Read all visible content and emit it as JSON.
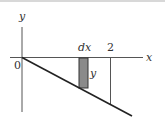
{
  "diagram": {
    "type": "integral-area-strip",
    "axes": {
      "x_label": "x",
      "y_label": "y",
      "origin_label": "0"
    },
    "line": {
      "description": "decreasing line through origin, below x-axis"
    },
    "strip": {
      "width_label": "dx",
      "height_label": "y",
      "fill": "#8a8a8a"
    },
    "bound": {
      "label": "2"
    },
    "colors": {
      "stroke": "#333333",
      "background": "#ffffff",
      "strip_fill": "#8a8a8a"
    }
  }
}
